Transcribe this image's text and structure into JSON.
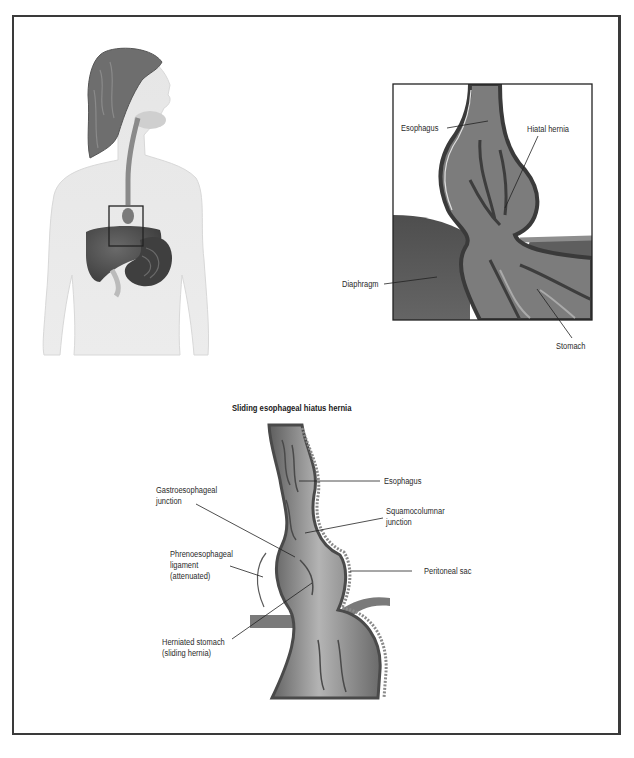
{
  "figure": {
    "body_panel": {
      "description": "Female torso silhouette showing esophagus, liver and stomach with a square marking the hernia region",
      "highlight_box": "hernia-location-box"
    },
    "inset_panel": {
      "labels": {
        "esophagus": "Esophagus",
        "hiatal_hernia": "Hiatal hernia",
        "diaphragm": "Diaphragm",
        "stomach": "Stomach"
      }
    },
    "detail_panel": {
      "title": "Sliding esophageal hiatus hernia",
      "labels": {
        "esophagus": "Esophagus",
        "gastroesophageal_1": "Gastroesophageal",
        "gastroesophageal_2": "junction",
        "squamocolumnar_1": "Squamocolumnar",
        "squamocolumnar_2": "junction",
        "phreno_1": "Phrenoesophageal",
        "phreno_2": "ligament",
        "phreno_3": "(attenuated)",
        "peritoneal_sac": "Peritoneal sac",
        "herniated_1": "Herniated stomach",
        "herniated_2": "(sliding hernia)"
      }
    },
    "colors": {
      "frame": "#3a3a3a",
      "skin": "#e4e4e4",
      "hair": "#6e6e6e",
      "organ_dark": "#4a4a4a",
      "tissue_mid": "#8a8a8a",
      "diaphragm": "#5a5a5a"
    }
  }
}
